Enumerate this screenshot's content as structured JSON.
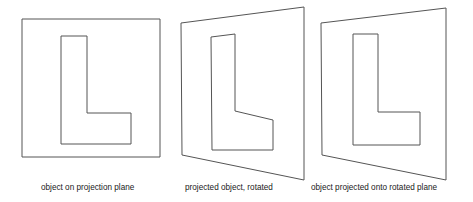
{
  "figure": {
    "background_color": "#ffffff",
    "stroke_color": "#555555",
    "width": 473,
    "height": 202,
    "panels": [
      {
        "id": "panel-1",
        "name": "object-on-projection-plane",
        "caption": "object on projection plane",
        "plane_shape": "square",
        "plane_points": "22,19 160,19 160,157 22,157",
        "letter_shape": "L",
        "letter_points": "61,36 87,36 87,113 131,113 131,144 61,144"
      },
      {
        "id": "panel-2",
        "name": "projected-object-rotated",
        "caption": "projected object, rotated",
        "plane_shape": "quadrilateral",
        "plane_points": "181,23 304,7 304,180 182,155",
        "letter_shape": "L",
        "letter_points": "211,37 235,34 235,111 273,120 273,150 212,150"
      },
      {
        "id": "panel-3",
        "name": "object-projected-onto-rotated-plane",
        "caption": "object projected onto rotated plane",
        "plane_shape": "quadrilateral",
        "plane_points": "321,23 446,8 446,180 322,155",
        "letter_shape": "L",
        "letter_points": "353,34 378,34 378,112 420,112 420,145 353,145"
      }
    ]
  }
}
